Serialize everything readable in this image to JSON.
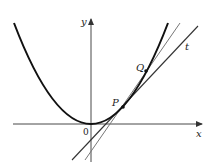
{
  "figure": {
    "labels": {
      "y_axis": "y",
      "x_axis": "x",
      "origin": "0",
      "point_p": "P",
      "point_q": "Q",
      "tangent": "t"
    },
    "colors": {
      "curve": "#111111",
      "axis": "#333333",
      "tangent_line": "#333333",
      "secant_line": "#777777",
      "background": "#ffffff"
    }
  }
}
